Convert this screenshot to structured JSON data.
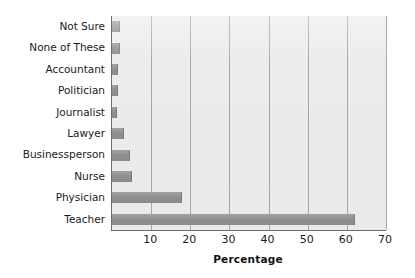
{
  "chart_data": {
    "type": "bar",
    "orientation": "horizontal",
    "title": "",
    "xlabel": "Percentage",
    "ylabel": "",
    "categories": [
      "Not Sure",
      "None of These",
      "Accountant",
      "Politician",
      "Journalist",
      "Lawyer",
      "Businessperson",
      "Nurse",
      "Physician",
      "Teacher"
    ],
    "values": [
      2,
      2,
      1.5,
      1.5,
      1.2,
      3,
      4.5,
      5,
      18,
      62
    ],
    "xlim": [
      0,
      70
    ],
    "xticks": [
      10,
      20,
      30,
      40,
      50,
      60,
      70
    ],
    "xtick_labels": [
      "10",
      "20",
      "30",
      "40",
      "50",
      "60",
      "70"
    ],
    "grid": "vertical",
    "legend": "none",
    "bar_color": "#929292",
    "plot_background": "#ececec",
    "gridline_color": "#a8a8a8",
    "axis_color": "#6e6e6e"
  }
}
